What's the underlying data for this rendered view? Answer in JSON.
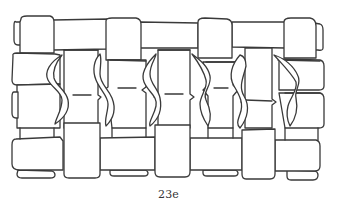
{
  "figure": {
    "caption": "23e",
    "colors": {
      "stroke": "#3a3a3a",
      "background": "#ffffff"
    }
  }
}
